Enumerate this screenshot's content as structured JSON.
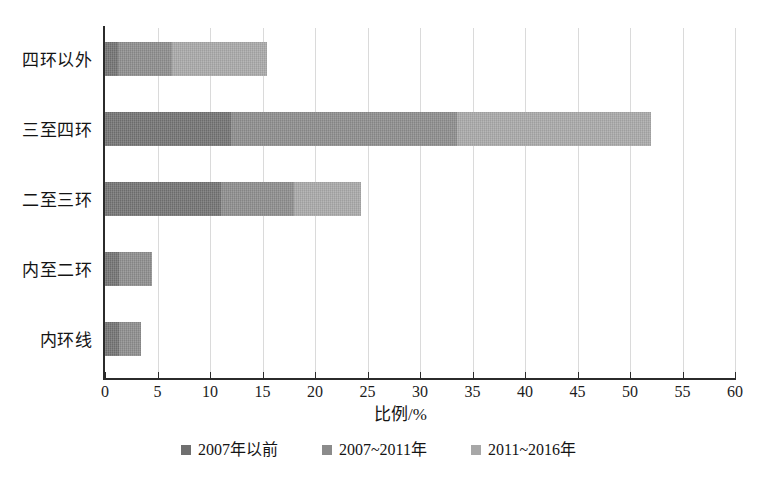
{
  "chart_data": {
    "type": "bar",
    "orientation": "horizontal",
    "stacked": true,
    "title": "",
    "xlabel": "比例/%",
    "ylabel": "",
    "xlim": [
      0,
      60
    ],
    "xticks": [
      0,
      5,
      10,
      15,
      20,
      25,
      30,
      35,
      40,
      45,
      50,
      55,
      60
    ],
    "grid": "vertical",
    "legend_position": "bottom",
    "categories": [
      "四环以外",
      "三至四环",
      "二至三环",
      "内至二环",
      "内环线"
    ],
    "series": [
      {
        "name": "2007年以前",
        "color": "#737373",
        "values": [
          1.2,
          12.0,
          11.0,
          1.3,
          1.3
        ]
      },
      {
        "name": "2007~2011年",
        "color": "#8d8d8d",
        "values": [
          5.2,
          21.5,
          7.0,
          3.2,
          2.1
        ]
      },
      {
        "name": "2011~2016年",
        "color": "#a9a9a9",
        "values": [
          9.0,
          18.5,
          6.4,
          0.0,
          0.0
        ]
      }
    ],
    "totals": [
      15.4,
      52.0,
      24.4,
      4.5,
      3.4
    ]
  },
  "axis": {
    "x_title": "比例/%",
    "tick_labels": [
      "0",
      "5",
      "10",
      "15",
      "20",
      "25",
      "30",
      "35",
      "40",
      "45",
      "50",
      "55",
      "60"
    ]
  },
  "categories": [
    {
      "label": "四环以外"
    },
    {
      "label": "三至四环"
    },
    {
      "label": "二至三环"
    },
    {
      "label": "内至二环"
    },
    {
      "label": "内环线"
    }
  ],
  "legend": {
    "items": [
      {
        "label": "2007年以前",
        "color": "#6f6f6f"
      },
      {
        "label": "2007~2011年",
        "color": "#8b8b8b"
      },
      {
        "label": "2011~2016年",
        "color": "#a7a7a7"
      }
    ]
  }
}
